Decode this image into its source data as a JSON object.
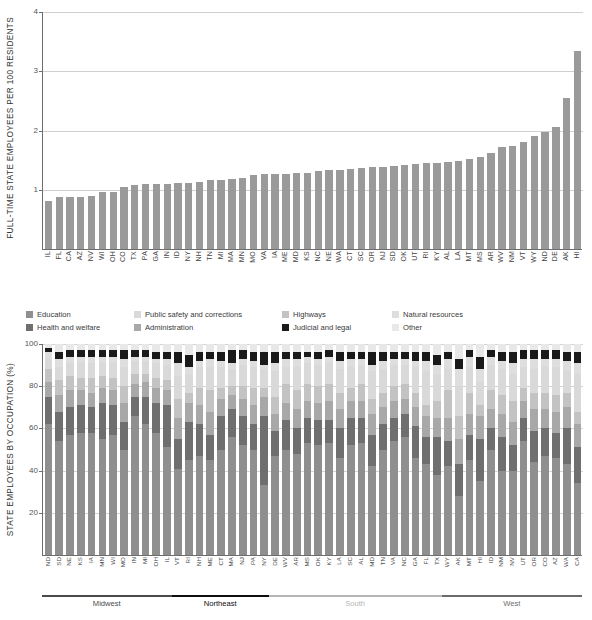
{
  "chart_data": [
    {
      "type": "bar",
      "title": "",
      "xlabel": "",
      "ylabel": "FULL-TIME STATE EMPLOYEES PER 100 RESIDENTS",
      "ylim": [
        0,
        4
      ],
      "yticks": [
        1,
        2,
        3,
        4
      ],
      "grid": true,
      "legend": "none",
      "bar_color": "#9a9a9a",
      "categories": [
        "IL",
        "FL",
        "CA",
        "AZ",
        "NV",
        "WI",
        "OH",
        "CO",
        "TX",
        "PA",
        "GA",
        "IN",
        "ID",
        "NY",
        "NH",
        "TN",
        "MI",
        "MA",
        "MN",
        "MO",
        "VA",
        "IA",
        "ME",
        "MD",
        "KS",
        "NC",
        "NE",
        "WA",
        "CT",
        "SC",
        "OR",
        "NJ",
        "SD",
        "OK",
        "UT",
        "RI",
        "KY",
        "AL",
        "LA",
        "MT",
        "MS",
        "AR",
        "WV",
        "NM",
        "VT",
        "WY",
        "ND",
        "DE",
        "AK",
        "HI"
      ],
      "values": [
        0.81,
        0.87,
        0.87,
        0.88,
        0.9,
        0.96,
        0.97,
        1.04,
        1.08,
        1.09,
        1.09,
        1.1,
        1.11,
        1.12,
        1.13,
        1.16,
        1.16,
        1.19,
        1.2,
        1.25,
        1.26,
        1.27,
        1.27,
        1.28,
        1.29,
        1.31,
        1.33,
        1.34,
        1.35,
        1.36,
        1.38,
        1.39,
        1.4,
        1.42,
        1.43,
        1.45,
        1.46,
        1.47,
        1.49,
        1.52,
        1.56,
        1.62,
        1.72,
        1.74,
        1.8,
        1.9,
        1.97,
        2.06,
        2.55,
        3.34,
        3.82
      ]
    },
    {
      "type": "bar",
      "subtype": "stacked-percent",
      "title": "",
      "xlabel": "",
      "ylabel": "STATE EMPLOYEES BY OCCUPATION (%)",
      "ylim": [
        0,
        100
      ],
      "yticks": [
        20,
        40,
        60,
        80,
        100
      ],
      "grid": true,
      "legend_position": "above-plot",
      "legend_entries": [
        {
          "label": "Education",
          "color": "#8f8f8f"
        },
        {
          "label": "Public safety and corrections",
          "color": "#d9d9d9"
        },
        {
          "label": "Highways",
          "color": "#c3c3c3"
        },
        {
          "label": "Natural resources",
          "color": "#dedede"
        },
        {
          "label": "Health and welfare",
          "color": "#6f6f6f"
        },
        {
          "label": "Administration",
          "color": "#a8a8a8"
        },
        {
          "label": "Judicial and legal",
          "color": "#1a1a1a"
        },
        {
          "label": "Other",
          "color": "#e8e8e8"
        }
      ],
      "categories": [
        "ND",
        "SD",
        "NE",
        "KS",
        "IA",
        "MN",
        "WI",
        "MO",
        "IN",
        "MI",
        "OH",
        "IL",
        "VT",
        "RI",
        "NH",
        "ME",
        "CT",
        "MA",
        "NJ",
        "PA",
        "NY",
        "DE",
        "WV",
        "AR",
        "MS",
        "OK",
        "KY",
        "LA",
        "SC",
        "AL",
        "MD",
        "TN",
        "VA",
        "NC",
        "GA",
        "FL",
        "TX",
        "WY",
        "AK",
        "MT",
        "HI",
        "ID",
        "NM",
        "NV",
        "UT",
        "OR",
        "CO",
        "AZ",
        "WA",
        "CA"
      ],
      "series": [
        {
          "name": "Education",
          "values": [
            62,
            54,
            57,
            58,
            58,
            55,
            57,
            50,
            66,
            62,
            58,
            51,
            41,
            45,
            47,
            45,
            50,
            56,
            52,
            50,
            33,
            47,
            50,
            48,
            53,
            52,
            53,
            46,
            52,
            53,
            42,
            50,
            54,
            56,
            46,
            43,
            38,
            42,
            28,
            45,
            35,
            50,
            40,
            40,
            54,
            44,
            47,
            46,
            43,
            34
          ]
        },
        {
          "name": "Health and welfare",
          "values": [
            13,
            14,
            13,
            13,
            12,
            17,
            14,
            13,
            9,
            13,
            14,
            20,
            14,
            18,
            15,
            12,
            16,
            13,
            14,
            12,
            33,
            12,
            14,
            12,
            12,
            12,
            11,
            14,
            13,
            12,
            15,
            12,
            11,
            11,
            15,
            13,
            18,
            12,
            15,
            12,
            20,
            10,
            16,
            12,
            11,
            15,
            13,
            12,
            17,
            17
          ]
        },
        {
          "name": "Administration",
          "values": [
            7,
            8,
            8,
            7,
            7,
            7,
            7,
            9,
            6,
            7,
            7,
            7,
            10,
            9,
            9,
            11,
            8,
            7,
            8,
            9,
            9,
            8,
            8,
            9,
            8,
            8,
            9,
            9,
            8,
            8,
            10,
            8,
            8,
            7,
            9,
            10,
            9,
            11,
            12,
            10,
            11,
            9,
            11,
            11,
            8,
            10,
            9,
            10,
            10,
            11
          ]
        },
        {
          "name": "Highways",
          "values": [
            6,
            7,
            7,
            6,
            7,
            6,
            6,
            8,
            5,
            4,
            5,
            5,
            9,
            5,
            8,
            10,
            5,
            4,
            6,
            8,
            4,
            8,
            9,
            9,
            8,
            8,
            8,
            8,
            6,
            8,
            7,
            7,
            7,
            7,
            7,
            5,
            8,
            13,
            11,
            10,
            5,
            9,
            9,
            10,
            6,
            8,
            8,
            8,
            7,
            6
          ]
        },
        {
          "name": "Public safety and corrections",
          "values": [
            5,
            6,
            6,
            7,
            7,
            6,
            7,
            9,
            6,
            6,
            7,
            7,
            11,
            9,
            10,
            11,
            10,
            8,
            10,
            10,
            9,
            12,
            8,
            11,
            10,
            10,
            10,
            11,
            10,
            9,
            13,
            11,
            10,
            9,
            12,
            16,
            13,
            10,
            14,
            12,
            11,
            12,
            12,
            13,
            10,
            11,
            12,
            13,
            10,
            18
          ]
        },
        {
          "name": "Natural resources",
          "values": [
            3,
            4,
            3,
            3,
            3,
            3,
            3,
            4,
            2,
            2,
            2,
            3,
            6,
            3,
            3,
            4,
            3,
            3,
            3,
            3,
            2,
            4,
            4,
            4,
            3,
            3,
            3,
            4,
            4,
            3,
            3,
            4,
            3,
            3,
            3,
            5,
            4,
            5,
            8,
            5,
            6,
            4,
            4,
            5,
            4,
            5,
            4,
            4,
            5,
            5
          ]
        },
        {
          "name": "Judicial and legal",
          "values": [
            2,
            3,
            3,
            3,
            3,
            3,
            3,
            4,
            3,
            3,
            3,
            3,
            5,
            6,
            4,
            3,
            4,
            6,
            4,
            4,
            6,
            5,
            3,
            3,
            2,
            3,
            3,
            4,
            3,
            3,
            6,
            4,
            3,
            3,
            4,
            4,
            5,
            3,
            5,
            3,
            6,
            3,
            4,
            5,
            4,
            4,
            4,
            4,
            4,
            5
          ]
        },
        {
          "name": "Other",
          "values": [
            2,
            4,
            3,
            3,
            3,
            3,
            3,
            3,
            3,
            3,
            4,
            4,
            4,
            5,
            4,
            4,
            4,
            3,
            3,
            4,
            4,
            4,
            4,
            4,
            4,
            4,
            3,
            4,
            4,
            4,
            4,
            4,
            4,
            4,
            4,
            4,
            5,
            4,
            7,
            3,
            6,
            3,
            4,
            4,
            3,
            3,
            3,
            3,
            4,
            4
          ]
        }
      ],
      "regions": [
        {
          "label": "Midwest",
          "count": 12,
          "color": "#4a4a4a"
        },
        {
          "label": "Northeast",
          "count": 9,
          "color": "#0d0d0d"
        },
        {
          "label": "South",
          "count": 16,
          "color": "#b6b6b6"
        },
        {
          "label": "West",
          "count": 13,
          "color": "#6b6b6b"
        }
      ]
    }
  ],
  "footnote": " "
}
